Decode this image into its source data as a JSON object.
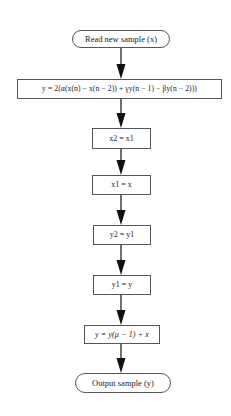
{
  "diagram": {
    "type": "flowchart",
    "direction": "top-to-bottom",
    "nodes": [
      {
        "id": "start",
        "shape": "terminator",
        "label": "Read new sample (x)"
      },
      {
        "id": "compute_y",
        "shape": "process",
        "label": "y = 2(α(x(n) − x(n − 2)) + γy(n − 1) − βy(n − 2)))"
      },
      {
        "id": "shift_x2",
        "shape": "process",
        "label": "x2 = x1"
      },
      {
        "id": "shift_x1",
        "shape": "process",
        "label": "x1 = x"
      },
      {
        "id": "shift_y2",
        "shape": "process",
        "label": "y2 = y1"
      },
      {
        "id": "shift_y1",
        "shape": "process",
        "label": "y1 = y"
      },
      {
        "id": "mix_output",
        "shape": "process",
        "label": "y = y(μ − 1) + x"
      },
      {
        "id": "end",
        "shape": "terminator",
        "label": "Output sample (y)"
      }
    ],
    "edges": [
      {
        "from": "start",
        "to": "compute_y"
      },
      {
        "from": "compute_y",
        "to": "shift_x2"
      },
      {
        "from": "shift_x2",
        "to": "shift_x1"
      },
      {
        "from": "shift_x1",
        "to": "shift_y2"
      },
      {
        "from": "shift_y2",
        "to": "shift_y1"
      },
      {
        "from": "shift_y1",
        "to": "mix_output"
      },
      {
        "from": "mix_output",
        "to": "end"
      }
    ]
  },
  "colors": {
    "background": "#ffffff",
    "stroke": "#555555",
    "arrow": "#111111",
    "text": "#222222"
  }
}
